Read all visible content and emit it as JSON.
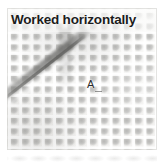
{
  "figure": {
    "kind": "photograph",
    "title": "Worked horizontally",
    "callout_label": "A",
    "colors": {
      "title_text": "#1c1c1c",
      "title_band": "#faf9f8",
      "fabric_background": "#f4f3f1",
      "stitch_gray": "#a7a7a5",
      "ladder_gray": "#6c6c6a",
      "callout_text": "#2b2b2b",
      "page_background": "#ffffff"
    },
    "fabric": {
      "stitch_columns": 13,
      "stitch_rows": 13,
      "pattern": "horizontal-knit-courses"
    },
    "annotations": [
      {
        "label": "A",
        "points_to": "diagonal-ladder-run"
      }
    ]
  }
}
